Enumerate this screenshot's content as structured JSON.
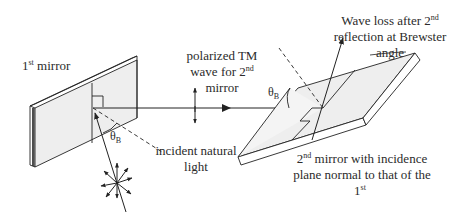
{
  "diagram": {
    "type": "physics-optics",
    "colors": {
      "line": "#222222",
      "mirror_fill": "#eeeeee",
      "mirror_edge_fill": "#ffffff",
      "background": "#ffffff"
    },
    "labels": {
      "first_mirror": {
        "base": "1",
        "sup": "st",
        "rest": " mirror"
      },
      "polarized_wave": {
        "line1": "polarized TM",
        "line2_base": "wave for 2",
        "line2_sup": "nd",
        "line3": "mirror"
      },
      "incident_light": {
        "line1": "incident natural",
        "line2": "light"
      },
      "wave_loss": {
        "line1_base": "Wave loss after 2",
        "line1_sup": "nd",
        "line2": "reflection at Brewster",
        "line3": "angle"
      },
      "second_mirror": {
        "line1_base": "2",
        "line1_sup": "nd",
        "line1_rest": " mirror with incidence",
        "line2": "plane normal to that of the",
        "line3_base": "1",
        "line3_sup": "st"
      },
      "brewster_angle_1": {
        "symbol": "θ",
        "sub": "B"
      },
      "brewster_angle_2": {
        "symbol": "θ",
        "sub": "B"
      }
    },
    "elements": [
      "first-mirror",
      "second-mirror",
      "incident-ray",
      "reflected-ray-1",
      "reflected-ray-2",
      "normal-1",
      "normal-2",
      "polarization-arrows-unpolarized",
      "polarization-arrow-tm",
      "brewster-arc-1",
      "brewster-arc-2"
    ]
  }
}
